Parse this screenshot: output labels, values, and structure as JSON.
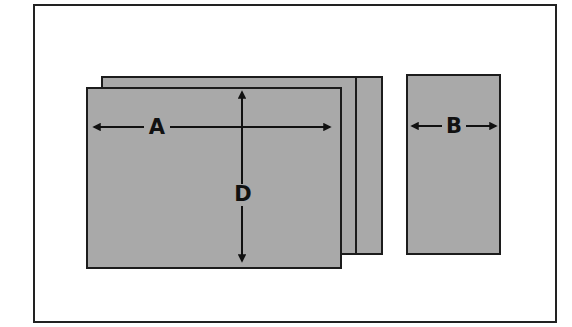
{
  "diagram": {
    "labels": {
      "width_label": "A",
      "depth_label": "D",
      "narrow_width_label": "B"
    },
    "colors": {
      "panel_fill": "#a9a9a9",
      "stroke": "#1c1c1c",
      "background": "#ffffff"
    },
    "shapes": [
      {
        "name": "back-sheet",
        "x": 101,
        "y": 76,
        "w": 282,
        "h": 178
      },
      {
        "name": "front-sheet",
        "x": 86,
        "y": 87,
        "w": 255,
        "h": 181
      },
      {
        "name": "narrow-panel",
        "x": 406,
        "y": 74,
        "w": 95,
        "h": 180
      }
    ],
    "dimensions": [
      {
        "label": "A",
        "orientation": "horizontal",
        "from": 93,
        "to": 331,
        "at": 127
      },
      {
        "label": "D",
        "orientation": "vertical",
        "from": 91,
        "to": 262,
        "at": 242
      },
      {
        "label": "B",
        "orientation": "horizontal",
        "from": 411,
        "to": 497,
        "at": 126
      }
    ]
  }
}
